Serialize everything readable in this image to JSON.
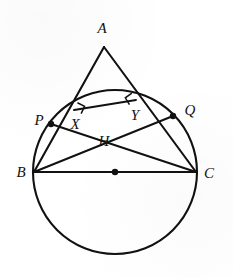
{
  "figure": {
    "labels": {
      "A": "A",
      "B": "B",
      "C": "C",
      "P": "P",
      "Q": "Q",
      "X": "X",
      "Y": "Y",
      "H": "H"
    },
    "colors": {
      "ink": "#111111",
      "background": "#ffffff"
    }
  },
  "chart_data": {
    "type": "diagram",
    "canvas": {
      "width": 233,
      "height": 278
    },
    "circle": {
      "cx": 115,
      "cy": 172,
      "r": 82,
      "center_marked": true
    },
    "points": [
      {
        "name": "A",
        "x": 104,
        "y": 47,
        "label": "A",
        "label_x": 102,
        "label_y": 33,
        "dot": false
      },
      {
        "name": "B",
        "x": 34,
        "y": 172,
        "label": "B",
        "label_x": 21,
        "label_y": 177,
        "dot": false
      },
      {
        "name": "C",
        "x": 196,
        "y": 172,
        "label": "C",
        "label_x": 203,
        "label_y": 178,
        "dot": false
      },
      {
        "name": "P",
        "x": 51,
        "y": 124,
        "label": "P",
        "label_x": 35,
        "label_y": 125,
        "dot": true
      },
      {
        "name": "Q",
        "x": 173,
        "y": 116,
        "label": "Q",
        "label_x": 184,
        "label_y": 115,
        "dot": true
      },
      {
        "name": "X",
        "x": 74,
        "y": 110,
        "label": "X",
        "label_x": 71,
        "label_y": 129,
        "dot": false
      },
      {
        "name": "Y",
        "x": 136,
        "y": 100,
        "label": "Y",
        "label_x": 131,
        "label_y": 120,
        "dot": false
      },
      {
        "name": "H",
        "x": 105,
        "y": 128,
        "label": "H",
        "label_x": 99,
        "label_y": 146,
        "dot": false
      },
      {
        "name": "O",
        "x": 115,
        "y": 172,
        "label": "",
        "label_x": 0,
        "label_y": 0,
        "dot": true
      }
    ],
    "segments": [
      {
        "from": "A",
        "to": "B",
        "weight": "thick"
      },
      {
        "from": "A",
        "to": "C",
        "weight": "thick"
      },
      {
        "from": "B",
        "to": "C",
        "weight": "thick"
      },
      {
        "from": "B",
        "to": "Q",
        "weight": "med"
      },
      {
        "from": "C",
        "to": "P",
        "weight": "med"
      },
      {
        "from": "X",
        "to": "Y",
        "weight": "med"
      }
    ],
    "right_angles": [
      {
        "at": "X",
        "x": 74,
        "y": 110
      },
      {
        "at": "Y",
        "x": 136,
        "y": 100
      }
    ]
  }
}
